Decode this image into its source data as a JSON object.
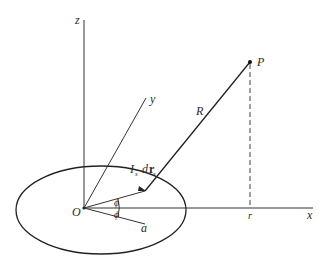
{
  "figure": {
    "type": "geometry-diagram",
    "labels": {
      "z_axis": "z",
      "y_axis": "y",
      "x_axis": "x",
      "origin": "O",
      "point": "P",
      "distance": "R",
      "radial": "r",
      "radius": "a",
      "angle_upper": "ϕ",
      "angle_lower": "ϕ",
      "current_element_I": "I",
      "current_element_I_sub": "s",
      "current_element_d": "d",
      "current_element_r": "r",
      "current_element_r_sub": "s"
    },
    "colors": {
      "line": "#333333",
      "text": "#2a2a2a",
      "background": "#ffffff"
    }
  }
}
